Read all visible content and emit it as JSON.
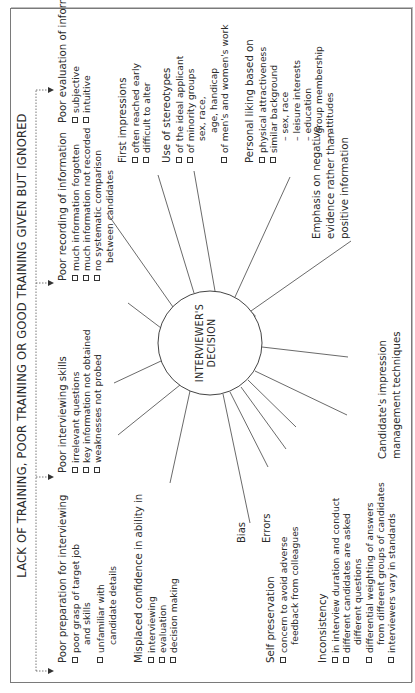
{
  "title": "LACK OF TRAINING, POOR TRAINING OR GOOD TRAINING GIVEN BUT IGNORED",
  "center": {
    "line1": "INTERVIEWER'S",
    "line2": "DECISION"
  },
  "top_factors": [
    {
      "heading": "Poor preparation for interviewing",
      "items": [
        {
          "text": "poor grasp of target job",
          "cont": "and skills"
        },
        {
          "text": "unfamiliar with",
          "cont": "candidate details"
        }
      ]
    },
    {
      "heading": "Poor interviewing skills",
      "items": [
        {
          "text": "irrelevant questions"
        },
        {
          "text": "key information not obtained"
        },
        {
          "text": "weaknesses not probed"
        }
      ]
    },
    {
      "heading": "Poor recording of information",
      "items": [
        {
          "text": "much information forgotten"
        },
        {
          "text": "much information not recorded"
        },
        {
          "text": "no systematic comparison",
          "cont": "between candidates"
        }
      ]
    },
    {
      "heading": "Poor evaluation of information",
      "items": [
        {
          "text": "subjective"
        },
        {
          "text": "intuitive"
        }
      ]
    }
  ],
  "right_factors": [
    {
      "heading": "First impressions",
      "items": [
        {
          "text": "often reached early"
        },
        {
          "text": "difficult to alter"
        }
      ]
    },
    {
      "heading": "Use of stereotypes",
      "items": [
        {
          "text": "of the ideal applicant"
        },
        {
          "text": "of minority groups",
          "sub": [
            "sex, race,",
            "age, handicap"
          ]
        },
        {
          "text": "of men's and women's work"
        }
      ]
    },
    {
      "heading": "Personal liking based on",
      "items": [
        {
          "text": "physical attractiveness"
        },
        {
          "text": "similar background",
          "sub": [
            "– sex, race",
            "– leisure interests",
            "– education",
            "– group membership",
            "– attitudes"
          ]
        }
      ]
    },
    {
      "heading": "Emphasis on negative",
      "lines": [
        "evidence rather than",
        "positive information"
      ]
    }
  ],
  "left_factors": [
    {
      "heading": "Misplaced confidence in ability in",
      "items": [
        {
          "text": "interviewing"
        },
        {
          "text": "evaluation"
        },
        {
          "text": "decision making"
        }
      ]
    },
    {
      "label": "Bias"
    },
    {
      "label": "Errors"
    },
    {
      "heading": "Self preservation",
      "items": [
        {
          "text": "concern to avoid adverse",
          "cont": "feedback from colleagues"
        }
      ]
    },
    {
      "heading": "Inconsistency",
      "items": [
        {
          "text": "in interview duration and conduct"
        },
        {
          "text": "different candidates are asked",
          "cont": "different questions"
        },
        {
          "text": "differential weighting of answers",
          "cont": "from different groups of candidates"
        },
        {
          "text": "interviewers vary in standards"
        }
      ]
    },
    {
      "heading": "Candidate's impression",
      "lines": [
        "management techniques"
      ]
    }
  ],
  "colors": {
    "line": "#444444",
    "frame": "#7a7a7a",
    "arc_shadow": "#a8a8a8"
  }
}
